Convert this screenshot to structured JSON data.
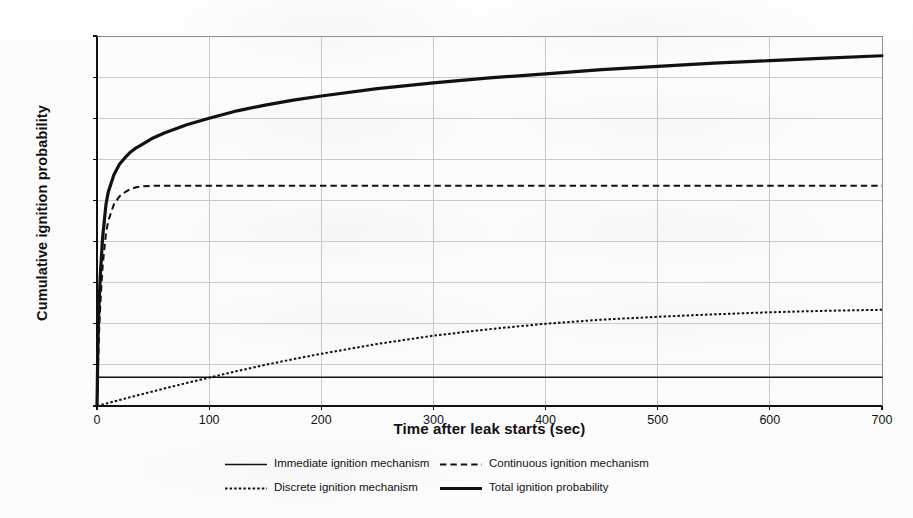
{
  "chart_data": {
    "type": "line",
    "title": "",
    "xlabel": "Time after leak starts (sec)",
    "ylabel": "Cumulative ignition probability",
    "xlim": [
      0,
      700
    ],
    "ylim": [
      0,
      4.5
    ],
    "xticks": [
      "0",
      "100",
      "200",
      "300",
      "400",
      "500",
      "600",
      "700"
    ],
    "xtick_values": [
      0,
      100,
      200,
      300,
      400,
      500,
      600,
      700
    ],
    "yticks": [
      "0,0 %",
      "0,5 %",
      "1,0 %",
      "1,5 %",
      "2,0 %",
      "2,5 %",
      "3,0 %",
      "3,5 %",
      "4,0 %",
      "4,5 %"
    ],
    "ytick_values": [
      0.0,
      0.5,
      1.0,
      1.5,
      2.0,
      2.5,
      3.0,
      3.5,
      4.0,
      4.5
    ],
    "grid": true,
    "legend_position": "bottom",
    "x": [
      0,
      1,
      2,
      3,
      5,
      8,
      10,
      15,
      20,
      25,
      30,
      35,
      40,
      50,
      60,
      80,
      100,
      125,
      150,
      175,
      200,
      250,
      300,
      350,
      400,
      450,
      500,
      550,
      600,
      650,
      700
    ],
    "series": [
      {
        "name": "Immediate ignition mechanism",
        "style": "solid",
        "width": 1.6,
        "color": "#111111",
        "values": [
          0.0,
          0.35,
          0.35,
          0.35,
          0.35,
          0.35,
          0.35,
          0.35,
          0.35,
          0.35,
          0.35,
          0.35,
          0.35,
          0.35,
          0.35,
          0.35,
          0.35,
          0.35,
          0.35,
          0.35,
          0.35,
          0.35,
          0.35,
          0.35,
          0.35,
          0.35,
          0.35,
          0.35,
          0.35,
          0.35,
          0.35
        ]
      },
      {
        "name": "Continuous ignition mechanism",
        "style": "dashed",
        "width": 2.0,
        "color": "#111111",
        "values": [
          0.0,
          0.55,
          0.95,
          1.25,
          1.7,
          2.1,
          2.25,
          2.45,
          2.55,
          2.6,
          2.64,
          2.66,
          2.67,
          2.68,
          2.68,
          2.68,
          2.68,
          2.68,
          2.68,
          2.68,
          2.68,
          2.68,
          2.68,
          2.68,
          2.68,
          2.68,
          2.68,
          2.68,
          2.68,
          2.68,
          2.68
        ]
      },
      {
        "name": "Discrete ignition mechanism",
        "style": "dotted",
        "width": 2.0,
        "color": "#111111",
        "values": [
          0.0,
          0.003,
          0.007,
          0.011,
          0.018,
          0.029,
          0.036,
          0.054,
          0.072,
          0.09,
          0.108,
          0.126,
          0.144,
          0.178,
          0.212,
          0.28,
          0.345,
          0.425,
          0.5,
          0.57,
          0.635,
          0.755,
          0.855,
          0.935,
          1.0,
          1.05,
          1.085,
          1.115,
          1.14,
          1.158,
          1.17
        ]
      },
      {
        "name": "Total ignition probability",
        "style": "solid",
        "width": 3.2,
        "color": "#111111",
        "values": [
          0.0,
          0.9,
          1.3,
          1.6,
          2.05,
          2.45,
          2.6,
          2.81,
          2.94,
          3.02,
          3.09,
          3.14,
          3.18,
          3.26,
          3.32,
          3.42,
          3.5,
          3.59,
          3.66,
          3.72,
          3.77,
          3.86,
          3.93,
          3.99,
          4.04,
          4.09,
          4.13,
          4.17,
          4.2,
          4.23,
          4.26
        ]
      }
    ],
    "legend": [
      {
        "label": "Immediate ignition mechanism",
        "style": "solid",
        "width": 1.6
      },
      {
        "label": "Continuous ignition mechanism",
        "style": "dashed",
        "width": 2.0
      },
      {
        "label": "Discrete ignition mechanism",
        "style": "dotted",
        "width": 2.0
      },
      {
        "label": "Total ignition probability",
        "style": "solid",
        "width": 3.2
      }
    ],
    "colors": {
      "axis": "#111111",
      "grid": "#c9c9c9",
      "plot_border": "#8f8f8f",
      "background": "#fdfdfd",
      "series": "#111111"
    }
  }
}
